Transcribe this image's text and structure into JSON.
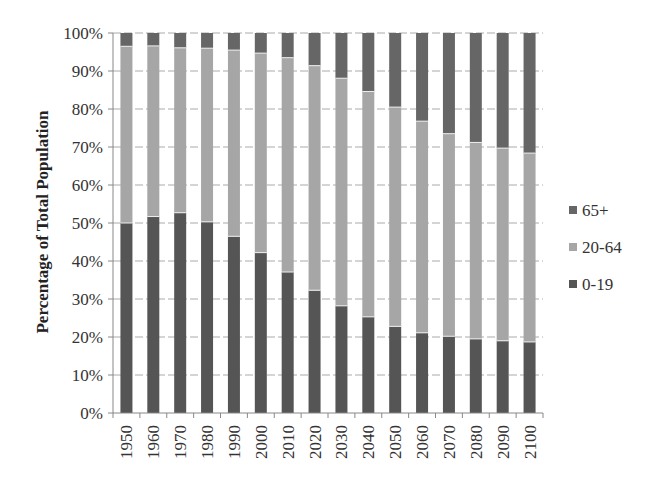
{
  "chart_data": {
    "type": "bar",
    "stacked": true,
    "percent": true,
    "title": "",
    "xlabel": "",
    "ylabel": "Percentage of Total Population",
    "ylim": [
      0,
      100
    ],
    "yticks": [
      "0%",
      "10%",
      "20%",
      "30%",
      "40%",
      "50%",
      "60%",
      "70%",
      "80%",
      "90%",
      "100%"
    ],
    "grid": "horizontal dashed",
    "legend_position": "right",
    "categories": [
      "1950",
      "1960",
      "1970",
      "1980",
      "1990",
      "2000",
      "2010",
      "2020",
      "2030",
      "2040",
      "2050",
      "2060",
      "2070",
      "2080",
      "2090",
      "2100"
    ],
    "series": [
      {
        "name": "0-19",
        "color": "#555555",
        "values": [
          50.0,
          51.7,
          52.7,
          50.3,
          46.5,
          42.2,
          37.1,
          32.3,
          28.2,
          25.3,
          22.8,
          21.1,
          20.2,
          19.5,
          19.0,
          18.7
        ]
      },
      {
        "name": "20-64",
        "color": "#a6a6a6",
        "values": [
          46.5,
          44.9,
          43.4,
          45.7,
          49.0,
          52.5,
          56.4,
          59.1,
          59.9,
          59.3,
          57.7,
          55.7,
          53.3,
          51.7,
          50.7,
          49.7
        ]
      },
      {
        "name": "65+",
        "color": "#666666",
        "values": [
          3.5,
          3.4,
          3.9,
          4.0,
          4.5,
          5.3,
          6.5,
          8.6,
          11.9,
          15.4,
          19.5,
          23.2,
          26.5,
          28.8,
          30.3,
          31.6
        ]
      }
    ],
    "legend": [
      "65+",
      "20-64",
      "0-19"
    ]
  }
}
